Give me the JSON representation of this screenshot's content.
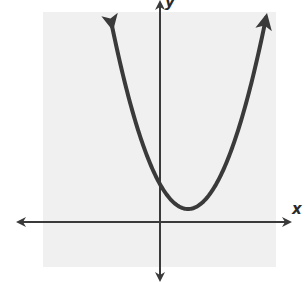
{
  "chart_data": {
    "type": "line",
    "title": "",
    "xlabel": "x",
    "ylabel": "y",
    "grid": false,
    "ticks": false,
    "legend": null,
    "series": [
      {
        "name": "parabola",
        "kind": "upward-opening parabola",
        "description": "No ticks or numeric labels are shown, so coordinates and coefficients are not readable from the image. Qualitatively: vertex lies right of the y-axis and above the x-axis, y-intercept is positive, and the curve has no x-intercepts.",
        "opens": "up",
        "vertex_quadrant": "I (x>0, y>0)",
        "y_intercept_sign": "positive",
        "x_intercepts": "none"
      }
    ],
    "annotations": [
      "arrowheads on both ends of curve",
      "arrowheads on both ends of both axes"
    ]
  },
  "labels": {
    "x_axis": "x",
    "y_axis": "y"
  },
  "colors": {
    "plot_background": "#f0f0f0",
    "page_background": "#ffffff",
    "curve": "#3a3a3a",
    "axes": "#3a3a3a"
  }
}
